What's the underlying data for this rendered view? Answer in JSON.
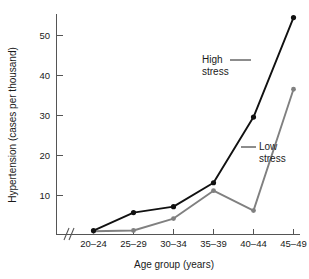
{
  "chart_data": {
    "type": "line",
    "title": "",
    "xlabel": "Age group (years)",
    "ylabel": "Hypertension (cases per thousand)",
    "categories": [
      "20–24",
      "25–29",
      "30–34",
      "35–39",
      "40–44",
      "45–49"
    ],
    "yticks": [
      10,
      20,
      30,
      40,
      50
    ],
    "ytick_labels": [
      "10",
      "20",
      "30",
      "40",
      "50"
    ],
    "ylim": [
      0,
      57
    ],
    "grid": false,
    "legend_position": "inline-annotations",
    "axis_break": {
      "present": true,
      "axis": "x",
      "symbol": "//"
    },
    "series": [
      {
        "name": "High stress",
        "color": "#111111",
        "marker": "filled-circle",
        "values": [
          1.0,
          5.5,
          7.0,
          13.0,
          29.5,
          54.5
        ]
      },
      {
        "name": "Low stress",
        "color": "#808080",
        "marker": "filled-circle",
        "values": [
          0.8,
          1.0,
          4.0,
          11.0,
          6.0,
          36.5
        ]
      }
    ],
    "annotations": [
      {
        "text_line1": "High",
        "text_line2": "stress",
        "target_series": "High stress"
      },
      {
        "text_line1": "Low",
        "text_line2": "stress",
        "target_series": "Low stress"
      }
    ]
  },
  "axes": {
    "y_title": "Hypertension (cases per thousand)",
    "x_title": "Age group (years)",
    "ytick_0": "10",
    "ytick_1": "20",
    "ytick_2": "30",
    "ytick_3": "40",
    "ytick_4": "50",
    "xtick_0": "20–24",
    "xtick_1": "25–29",
    "xtick_2": "30–34",
    "xtick_3": "35–39",
    "xtick_4": "40–44",
    "xtick_5": "45–49"
  },
  "annotations": {
    "high_line1": "High",
    "high_line2": "stress",
    "low_line1": "Low",
    "low_line2": "stress"
  },
  "colors": {
    "high_stress": "#111111",
    "low_stress": "#808080",
    "axis": "#555555",
    "text": "#1a1a1a",
    "background": "#ffffff"
  }
}
